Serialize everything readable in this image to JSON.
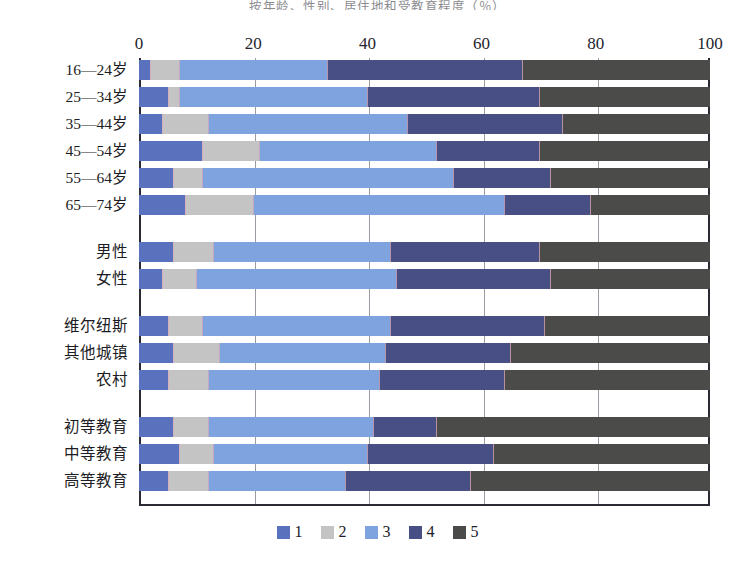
{
  "title": "按年龄、性别、居住地和受教育程度（％）",
  "legend": {
    "position": "bottom",
    "entries": [
      {
        "label": "1",
        "color": "#5a72bd"
      },
      {
        "label": "2",
        "color": "#c3c4c3"
      },
      {
        "label": "3",
        "color": "#7ea3de"
      },
      {
        "label": "4",
        "color": "#484f85"
      },
      {
        "label": "5",
        "color": "#4b4b49"
      }
    ]
  },
  "axis": {
    "ticks": [
      0,
      20,
      40,
      60,
      80,
      100
    ],
    "min": 0,
    "max": 100
  },
  "chart_data": {
    "type": "bar",
    "orientation": "horizontal",
    "stacked": true,
    "stack_total": 100,
    "title": "按年龄、性别、居住地和受教育程度（％）",
    "xlabel": "",
    "ylabel": "",
    "xlim": [
      0,
      100
    ],
    "grid": true,
    "legend_position": "bottom",
    "categories": [
      "16—24岁",
      "25—34岁",
      "35—44岁",
      "45—54岁",
      "55—64岁",
      "65—74岁",
      "男性",
      "女性",
      "维尔纽斯",
      "其他城镇",
      "农村",
      "初等教育",
      "中等教育",
      "高等教育"
    ],
    "group_breaks": [
      6,
      8,
      11
    ],
    "series": [
      {
        "name": "1",
        "color": "#5a72bd",
        "values": [
          2,
          5,
          4,
          11,
          6,
          8,
          6,
          4,
          5,
          6,
          5,
          6,
          7,
          5
        ]
      },
      {
        "name": "2",
        "color": "#c3c4c3",
        "values": [
          5,
          2,
          8,
          10,
          5,
          12,
          7,
          6,
          6,
          8,
          7,
          6,
          6,
          7
        ]
      },
      {
        "name": "3",
        "color": "#7ea3de",
        "values": [
          26,
          33,
          35,
          31,
          44,
          44,
          31,
          35,
          33,
          29,
          30,
          29,
          27,
          24
        ]
      },
      {
        "name": "4",
        "color": "#484f85",
        "values": [
          34,
          30,
          27,
          18,
          17,
          15,
          26,
          27,
          27,
          22,
          22,
          11,
          22,
          22
        ]
      },
      {
        "name": "5",
        "color": "#4b4b49",
        "values": [
          33,
          30,
          26,
          30,
          28,
          21,
          30,
          28,
          29,
          35,
          36,
          48,
          38,
          42
        ]
      }
    ]
  },
  "rows": [
    {
      "label": "16—24岁",
      "values": [
        2,
        5,
        26,
        34,
        33
      ]
    },
    {
      "label": "25—34岁",
      "values": [
        5,
        2,
        33,
        30,
        30
      ]
    },
    {
      "label": "35—44岁",
      "values": [
        4,
        8,
        35,
        27,
        26
      ]
    },
    {
      "label": "45—54岁",
      "values": [
        11,
        10,
        31,
        18,
        30
      ]
    },
    {
      "label": "55—64岁",
      "values": [
        6,
        5,
        44,
        17,
        28
      ]
    },
    {
      "label": "65—74岁",
      "values": [
        8,
        12,
        44,
        15,
        21
      ]
    },
    {
      "label": "男性",
      "values": [
        6,
        7,
        31,
        26,
        30
      ]
    },
    {
      "label": "女性",
      "values": [
        4,
        6,
        35,
        27,
        28
      ]
    },
    {
      "label": "维尔纽斯",
      "values": [
        5,
        6,
        33,
        27,
        29
      ]
    },
    {
      "label": "其他城镇",
      "values": [
        6,
        8,
        29,
        22,
        35
      ]
    },
    {
      "label": "农村",
      "values": [
        5,
        7,
        30,
        22,
        36
      ]
    },
    {
      "label": "初等教育",
      "values": [
        6,
        6,
        29,
        11,
        48
      ]
    },
    {
      "label": "中等教育",
      "values": [
        7,
        6,
        27,
        22,
        38
      ]
    },
    {
      "label": "高等教育",
      "values": [
        5,
        7,
        24,
        22,
        42
      ]
    }
  ]
}
